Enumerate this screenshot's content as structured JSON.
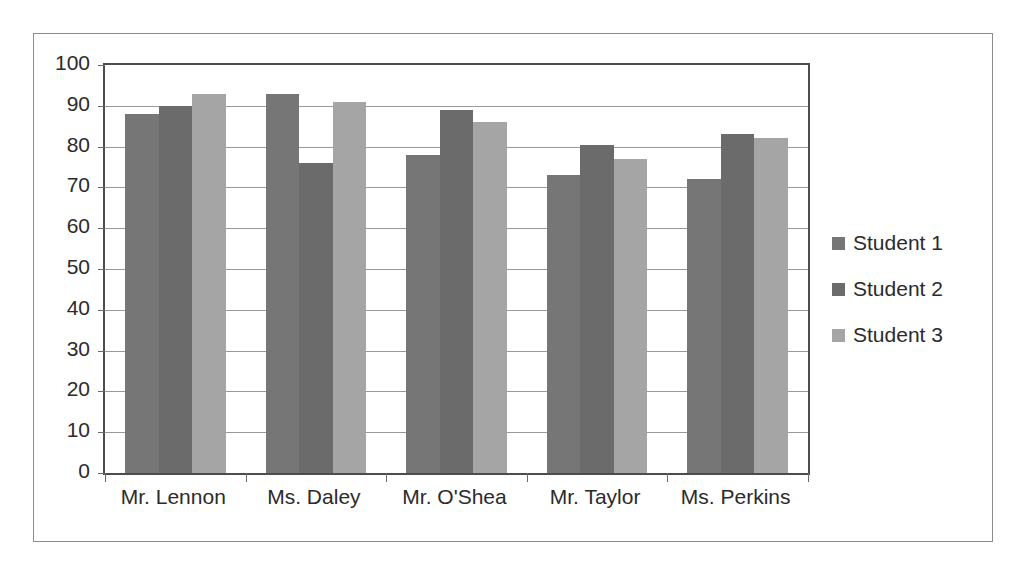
{
  "chart_data": {
    "type": "bar",
    "title": "",
    "subtitle": "",
    "xlabel": "",
    "ylabel": "",
    "categories": [
      "Mr. Lennon",
      "Ms. Daley",
      "Mr. O'Shea",
      "Mr. Taylor",
      "Ms. Perkins"
    ],
    "series": [
      {
        "name": "Student 1",
        "color": "#767676",
        "values": [
          88,
          93,
          78,
          73,
          72
        ]
      },
      {
        "name": "Student 2",
        "color": "#6b6b6b",
        "values": [
          90,
          76,
          89,
          80.5,
          83
        ]
      },
      {
        "name": "Student 3",
        "color": "#a5a5a5",
        "values": [
          93,
          91,
          86,
          77,
          82
        ]
      }
    ],
    "ylim": [
      0,
      100
    ],
    "ytick_step": 10,
    "yticks": [
      "100",
      "90",
      "80",
      "70",
      "60",
      "50",
      "40",
      "30",
      "20",
      "10",
      "0"
    ],
    "grid": "horizontal",
    "legend_position": "right",
    "annotations": [],
    "plot_border_color": "#4d4d4d",
    "gridline_color": "#9a9a9a",
    "frame_border_color": "#8d8d8d",
    "background_color": "#ffffff"
  },
  "legend": {
    "items": [
      {
        "label": "Student 1"
      },
      {
        "label": "Student 2"
      },
      {
        "label": "Student 3"
      }
    ]
  }
}
